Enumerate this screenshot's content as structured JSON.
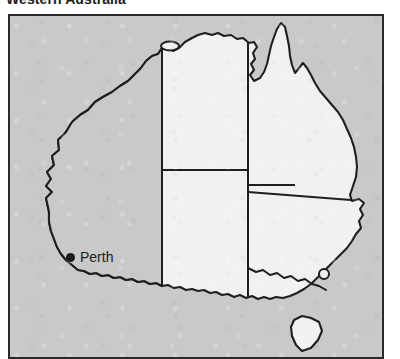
{
  "figure": {
    "title": "Western Australia",
    "frame": {
      "border_color": "#2a2a2a"
    }
  },
  "map": {
    "region": "Australia",
    "projection_note": "outline map",
    "colors": {
      "sea_background": "#c9c9c9",
      "highlighted_state_fill": "#c9c9c9",
      "other_state_fill": "#f1f1f1",
      "coastline": "#1f1f1f",
      "state_border": "#1f1f1f",
      "marker": "#1a1a1a",
      "label_text": "#1c1c1c"
    },
    "highlighted_state": "Western Australia",
    "states": [
      {
        "id": "western-australia",
        "name": "Western Australia",
        "highlighted": true
      },
      {
        "id": "northern-territory",
        "name": "Northern Territory",
        "highlighted": false
      },
      {
        "id": "queensland",
        "name": "Queensland",
        "highlighted": false
      },
      {
        "id": "south-australia",
        "name": "South Australia",
        "highlighted": false
      },
      {
        "id": "new-south-wales",
        "name": "New South Wales",
        "highlighted": false
      },
      {
        "id": "victoria",
        "name": "Victoria",
        "highlighted": false
      },
      {
        "id": "tasmania",
        "name": "Tasmania",
        "highlighted": false
      }
    ],
    "cities": [
      {
        "id": "perth",
        "label": "Perth",
        "marker": "filled-circle"
      }
    ],
    "annotations": [
      {
        "id": "act-circle",
        "shape": "small-open-circle"
      }
    ]
  }
}
